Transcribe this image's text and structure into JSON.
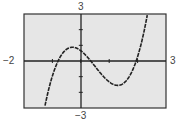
{
  "chart_data": {
    "type": "line",
    "title": "",
    "xlabel": "",
    "ylabel": "",
    "xlim": [
      -2,
      3
    ],
    "ylim": [
      -3,
      3
    ],
    "grid": false,
    "legend": null,
    "window_labels": {
      "xmin": "−2",
      "xmax": "3",
      "ymin": "−3",
      "ymax": "3"
    },
    "x_ticks": [
      -1,
      0,
      1,
      2
    ],
    "y_ticks": [
      -2,
      -1,
      1,
      2
    ],
    "series": [
      {
        "name": "f(x)",
        "description": "cubic curve with roots near x=-0.8, 0.35, 1.95; local max ~(-0.35, 0.85), local min ~(1.3, -1.4)",
        "x": [
          -1.3,
          -1.0,
          -0.8,
          -0.6,
          -0.35,
          -0.1,
          0.0,
          0.35,
          0.7,
          1.0,
          1.3,
          1.6,
          1.95,
          2.2,
          2.5,
          2.7
        ],
        "y": [
          -3.0,
          -1.3,
          0.0,
          0.6,
          0.85,
          0.7,
          0.66,
          0.0,
          -0.8,
          -1.25,
          -1.4,
          -1.1,
          0.0,
          1.3,
          3.0,
          3.0
        ]
      }
    ],
    "colors": {
      "background": "#e6e6e6",
      "frame": "#333333",
      "axis": "#222222",
      "curve": "#222222"
    }
  }
}
